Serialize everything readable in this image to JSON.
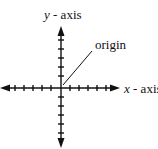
{
  "diagram": {
    "type": "coordinate-axes",
    "labels": {
      "y_axis_var": "y",
      "y_axis_rest": " - axis",
      "x_axis_var": "x",
      "x_axis_rest": " - axis",
      "origin": "origin"
    },
    "colors": {
      "stroke": "#111111",
      "background": "#ffffff"
    }
  }
}
